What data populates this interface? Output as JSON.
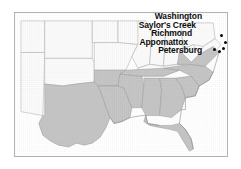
{
  "figure": {
    "type": "map",
    "title": "",
    "region": "Southeastern United States",
    "background_color": "#ffffff",
    "frame_color": "#b3b3b3"
  },
  "map": {
    "shaded_region_name": "Confederate States",
    "shaded_fill_color": "#c5c5c5",
    "unshaded_fill_color": "#fbfbfb",
    "border_color": "#9a9a9a",
    "coastline_color": "#8c8c8c",
    "shaded_states": [
      "Texas",
      "Louisiana",
      "Arkansas",
      "Mississippi",
      "Alabama",
      "Tennessee",
      "Georgia",
      "Florida",
      "South Carolina",
      "North Carolina",
      "Virginia"
    ],
    "unshaded_states": [
      "New Mexico",
      "Colorado",
      "Kansas",
      "Nebraska",
      "Iowa",
      "Missouri",
      "Oklahoma",
      "Illinois",
      "Indiana",
      "Ohio",
      "Kentucky",
      "West Virginia",
      "Maryland",
      "Pennsylvania"
    ]
  },
  "labels": [
    {
      "text": "Washington",
      "marker": true
    },
    {
      "text": "Saylor's Creek",
      "marker": true
    },
    {
      "text": "Richmond",
      "marker": true
    },
    {
      "text": "Appomattox",
      "marker": true
    },
    {
      "text": "Petersburg",
      "marker": true
    }
  ],
  "markers": [
    {
      "name": "washington-marker",
      "x": 205,
      "y": 21
    },
    {
      "name": "saylors-creek-marker",
      "x": 209,
      "y": 28
    },
    {
      "name": "richmond-marker",
      "x": 207,
      "y": 34
    },
    {
      "name": "appomattox-marker",
      "x": 198,
      "y": 35
    },
    {
      "name": "petersburg-marker",
      "x": 204,
      "y": 37
    }
  ]
}
